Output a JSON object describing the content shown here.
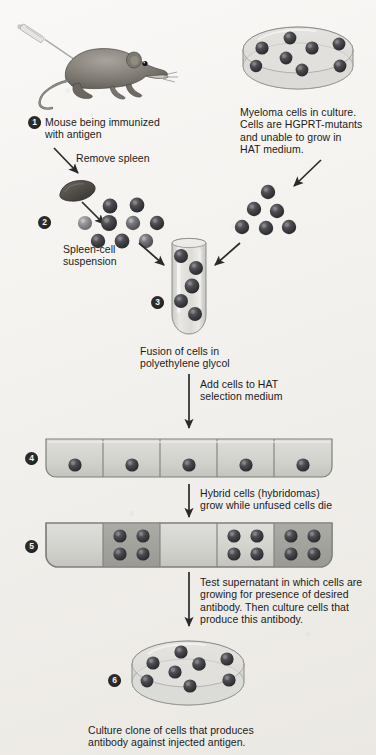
{
  "figure": {
    "background_color": "#f2f0ec",
    "cell_color_dark": "#3a3a3f",
    "cell_color_mid": "#6f6f72",
    "cell_color_light": "#8e8e90"
  },
  "steps": [
    {
      "number": "1",
      "caption": "Mouse being immunized\nwith antigen",
      "caption_line1": "Mouse being immunized",
      "caption_line2": "with antigen",
      "icon": "mouse-with-syringe"
    },
    {
      "number": "2",
      "caption_line1": "Spleen-cell",
      "caption_line2": "suspension",
      "icon": "spleen-cell-cluster"
    },
    {
      "number": "3",
      "caption_line1": "Fusion of cells in",
      "caption_line2": "polyethylene glycol",
      "icon": "test-tube"
    },
    {
      "number": "4",
      "caption_line1": "",
      "icon": "culture-tray-single-cells"
    },
    {
      "number": "5",
      "caption_line1": "",
      "icon": "culture-tray-colonies"
    },
    {
      "number": "6",
      "caption_line1": "Culture clone of cells that produces",
      "caption_line2": "antibody against injected antigen.",
      "icon": "petri-dish-clone"
    }
  ],
  "labels": {
    "remove_spleen": "Remove spleen",
    "myeloma_line1": "Myeloma cells in culture.",
    "myeloma_line2": "Cells are HGPRT-mutants",
    "myeloma_line3": "and unable to grow in",
    "myeloma_line4": "HAT medium.",
    "add_hat_line1": "Add cells to HAT",
    "add_hat_line2": "selection medium",
    "hybrid_line1": "Hybrid cells (hybridomas)",
    "hybrid_line2": "grow while unfused cells die",
    "test_line1": "Test supernatant in which cells are",
    "test_line2": "growing for presence of desired",
    "test_line3": "antibody. Then culture cells that",
    "test_line4": "produce this antibody."
  },
  "diagram_data": {
    "myeloma_dish_cell_count": 8,
    "spleen_cluster_cell_count": 9,
    "myeloma_cluster_cell_count": 6,
    "test_tube_cell_count": 5,
    "tray_step4_wells": 5,
    "tray_step4_cells_per_well": [
      1,
      1,
      1,
      1,
      1
    ],
    "tray_step5_wells": 5,
    "tray_step5_cells_per_well": [
      0,
      4,
      0,
      4,
      4
    ],
    "tray_step5_well_shaded": [
      false,
      true,
      false,
      false,
      true
    ],
    "final_dish_cell_count": 8
  }
}
